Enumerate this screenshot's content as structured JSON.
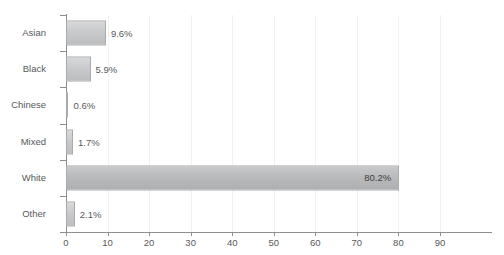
{
  "chart_data": {
    "type": "bar",
    "orientation": "horizontal",
    "title": "",
    "xlabel": "",
    "ylabel": "",
    "categories": [
      "Asian",
      "Black",
      "Chinese",
      "Mixed",
      "White",
      "Other"
    ],
    "values": [
      9.6,
      5.9,
      0.6,
      1.7,
      80.2,
      2.1
    ],
    "value_labels": [
      "9.6%",
      "5.9%",
      "0.6%",
      "1.7%",
      "80.2%",
      "2.1%"
    ],
    "label_placement": [
      "outside",
      "outside",
      "outside",
      "outside",
      "inside",
      "outside"
    ],
    "xlim": [
      0,
      90
    ],
    "xticks": [
      0,
      10,
      20,
      30,
      40,
      50,
      60,
      70,
      80,
      90
    ],
    "xtick_labels": [
      "0",
      "10",
      "20",
      "30",
      "40",
      "50",
      "60",
      "70",
      "80",
      "90"
    ],
    "grid": "vertical",
    "legend": "none",
    "colors": {
      "bar_fill_top": "#d8d9da",
      "bar_fill_bottom": "#bcbdbf",
      "bar_border": "#a9aaac",
      "axis": "#8d8e90",
      "gridline": "#f2f2f3",
      "text": "#58595b",
      "background": "#ffffff"
    }
  }
}
